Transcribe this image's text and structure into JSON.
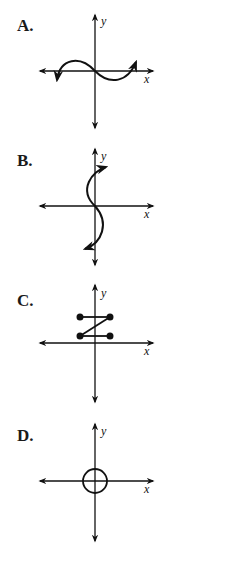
{
  "question_options": [
    {
      "letter": "A.",
      "description": "cubic-like curve through origin, rising left hump then falling, arrows at both ends"
    },
    {
      "letter": "B.",
      "description": "S-shaped curve along the y-axis (sideways cubic), arrows at both ends"
    },
    {
      "letter": "C.",
      "description": "Z-shaped segments: top horizontal, diagonal, bottom horizontal with endpoint dots"
    },
    {
      "letter": "D.",
      "description": "circle centered at origin"
    }
  ],
  "axes": {
    "x_label": "x",
    "y_label": "y"
  },
  "colors": {
    "ink": "#111111",
    "background": "#ffffff"
  }
}
